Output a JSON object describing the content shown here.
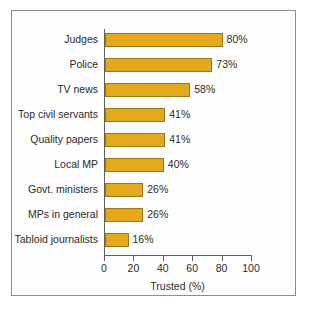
{
  "chart_data": {
    "type": "bar",
    "orientation": "horizontal",
    "title": "",
    "xlabel": "Trusted (%)",
    "ylabel": "",
    "xlim": [
      0,
      100
    ],
    "xticks": [
      "0",
      "20",
      "40",
      "60",
      "80",
      "100"
    ],
    "grid": false,
    "legend": null,
    "categories": [
      "Judges",
      "Police",
      "TV news",
      "Top civil servants",
      "Quality papers",
      "Local MP",
      "Govt. ministers",
      "MPs in general",
      "Tabloid journalists"
    ],
    "values": [
      80,
      73,
      58,
      41,
      41,
      40,
      26,
      26,
      16
    ],
    "data_labels": [
      "80%",
      "73%",
      "58%",
      "41%",
      "41%",
      "40%",
      "26%",
      "26%",
      "16%"
    ],
    "colors": {
      "bar_fill": "#e3a81b",
      "bar_border": "#9a7a15",
      "axis": "#5f5f5f",
      "text": "#2b2b2b",
      "frame": "#8d8d8d",
      "background": "#fefefe"
    }
  }
}
